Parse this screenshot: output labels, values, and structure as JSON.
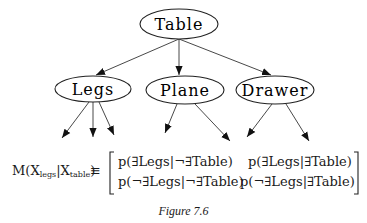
{
  "diagram": {
    "type": "tree",
    "nodes": [
      {
        "id": "table",
        "label": "Table",
        "cx": 179,
        "cy": 24,
        "rx": 39,
        "ry": 15
      },
      {
        "id": "legs",
        "label": "Legs",
        "cx": 93,
        "cy": 89,
        "rx": 38,
        "ry": 13
      },
      {
        "id": "plane",
        "label": "Plane",
        "cx": 185,
        "cy": 90,
        "rx": 39,
        "ry": 14
      },
      {
        "id": "drawer",
        "label": "Drawer",
        "cx": 275,
        "cy": 90,
        "rx": 39,
        "ry": 14
      }
    ],
    "edges": [
      {
        "from": "table",
        "to": "legs"
      },
      {
        "from": "table",
        "to": "plane"
      },
      {
        "from": "table",
        "to": "drawer"
      },
      {
        "from": "legs",
        "to": "child-1"
      },
      {
        "from": "legs",
        "to": "child-2"
      },
      {
        "from": "legs",
        "to": "child-3"
      },
      {
        "from": "plane",
        "to": "child-1"
      },
      {
        "from": "plane",
        "to": "child-2"
      },
      {
        "from": "drawer",
        "to": "child-1"
      },
      {
        "from": "drawer",
        "to": "child-2"
      }
    ]
  },
  "equation": {
    "lhs_M": "M(",
    "lhs_X1": "X",
    "lhs_sub1": "legs",
    "lhs_bar": "|",
    "lhs_X2": "X",
    "lhs_sub2": "table",
    "lhs_close": ")",
    "equiv": "≡",
    "matrix": [
      [
        "p(∃Legs|¬∃Table)",
        "p(∃Legs|∃Table)"
      ],
      [
        "p(¬∃Legs|¬∃Table)",
        "p(¬∃Legs|∃Table)"
      ]
    ]
  },
  "caption": "Figure 7.6"
}
